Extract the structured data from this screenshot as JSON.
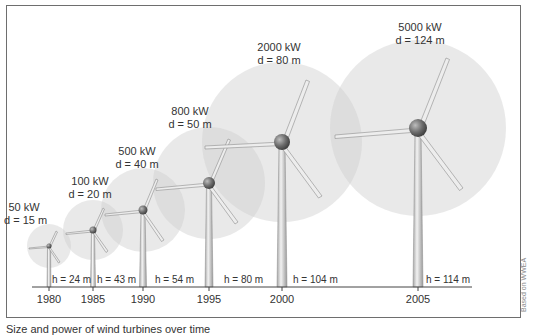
{
  "diagram": {
    "title": "",
    "turbines": [
      {
        "year": "1980",
        "power": "50 kW",
        "diameter": "d = 15 m",
        "height": "h = 24 m"
      },
      {
        "year": "1985",
        "power": "100 kW",
        "diameter": "d = 20 m",
        "height": "h = 43 m"
      },
      {
        "year": "1990",
        "power": "500 kW",
        "diameter": "d = 40 m",
        "height": "h = 54 m"
      },
      {
        "year": "1995",
        "power": "800 kW",
        "diameter": "d = 50 m",
        "height": "h = 80 m"
      },
      {
        "year": "2000",
        "power": "2000 kW",
        "diameter": "d = 80 m",
        "height": "h = 104 m"
      },
      {
        "year": "2005",
        "power": "5000 kW",
        "diameter": "d = 124 m",
        "height": "h = 114 m"
      }
    ],
    "credit": "Based on WWEA",
    "caption": "Size and power of wind turbines over time",
    "colors": {
      "frame": "#6e6e6e",
      "rotor_disc": "#d9d9d9",
      "tower": "#c8c8c8",
      "hub": "#7a7a7a",
      "axis": "#444444"
    }
  }
}
